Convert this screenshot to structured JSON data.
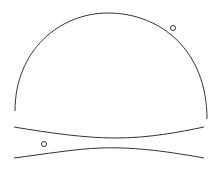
{
  "diagram": {
    "stroke_color": "#333333",
    "background": "#ffffff",
    "elements": [
      {
        "type": "arc",
        "name": "dome"
      },
      {
        "type": "curve",
        "name": "upper-channel-line"
      },
      {
        "type": "curve",
        "name": "lower-channel-line"
      },
      {
        "type": "circle",
        "name": "dome-particle"
      },
      {
        "type": "circle",
        "name": "channel-particle"
      }
    ]
  }
}
